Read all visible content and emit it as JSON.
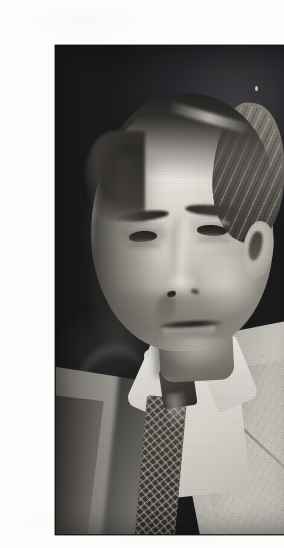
{
  "document": {
    "type": "scanned-page",
    "page_background": "#fdfdfc",
    "caption": ""
  },
  "photograph": {
    "title": "Portrait photograph of a man",
    "medium": "black-and-white halftone print",
    "orientation": "portrait",
    "frame": {
      "left": 15,
      "top": 29,
      "width": 253,
      "height": 490,
      "border_color": "#141416"
    },
    "palette": {
      "paper": "#fdfdfc",
      "background_dark": "#1d1d20",
      "background_highlight": "#3a3a3e",
      "skin_highlight": "#e8e4db",
      "skin_midtone": "#b9b5ab",
      "skin_shadow": "#6d6a62",
      "hair_dark": "#1c1b19",
      "hair_light": "#8e897f",
      "shirt_white": "#f2f0ea",
      "jacket_light": "#d2cfc7",
      "jacket_shadow": "#6e6b64",
      "tie_dark": "#2a2724",
      "tie_pattern": "#e4e0d6"
    },
    "subject": {
      "description": "Middle-aged to elderly man in three-quarter bust view, facing slightly left of camera, neutral expression",
      "features": [
        {
          "name": "hair",
          "note": "receding hairline, swept back, light at right temple, dark at crown"
        },
        {
          "name": "forehead",
          "note": "high and brightly lit"
        },
        {
          "name": "eyebrows",
          "note": "dark, level, heavy"
        },
        {
          "name": "eyes",
          "note": "deep-set, dark, steady gaze toward viewer"
        },
        {
          "name": "ear",
          "note": "right ear (viewer right) catching light against dark ground"
        },
        {
          "name": "nose",
          "note": "straight with lit bridge, shadowed left side"
        },
        {
          "name": "mouth",
          "note": "closed, thin-lipped, neutral"
        },
        {
          "name": "collar",
          "note": "white stiff shirt collar, points spread"
        },
        {
          "name": "tie",
          "note": "dark knitted tie with light checkered/diamond pattern"
        },
        {
          "name": "jacket",
          "note": "light tweed suit jacket, wide lapel across right shoulder"
        }
      ],
      "lighting": "strong key light from upper right, left side of face in deep shadow",
      "background": "dark studio ground with a faint ghosted secondary shape at lower left"
    },
    "artifacts": [
      {
        "name": "dust-speck",
        "note": "small white speck in dark background upper right"
      },
      {
        "name": "halftone-screen",
        "note": "visible printing dot screen across the whole image"
      },
      {
        "name": "paper-grain",
        "note": "faint scanner mottling in the white margins"
      }
    ]
  }
}
